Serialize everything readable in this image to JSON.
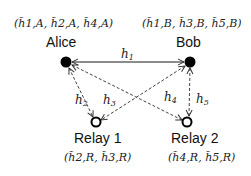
{
  "nodes": {
    "alice": {
      "label": "Alice",
      "tuple": "(h̃1,A, h̃2,A, h̃4,A)"
    },
    "bob": {
      "label": "Bob",
      "tuple": "(h̃1,B, h̃3,B, h̃5,B)"
    },
    "relay1": {
      "label": "Relay 1",
      "tuple": "(h̃2,R, h̃3,R)"
    },
    "relay2": {
      "label": "Relay 2",
      "tuple": "(h̃4,R, h̃5,R)"
    }
  },
  "edges": {
    "h1": {
      "label": "h",
      "sub": "1",
      "from": "alice",
      "to": "bob",
      "style": "solid"
    },
    "h2": {
      "label": "h",
      "sub": "2",
      "from": "alice",
      "to": "relay1",
      "style": "dashed"
    },
    "h3": {
      "label": "h",
      "sub": "3",
      "from": "bob",
      "to": "relay1",
      "style": "dashed"
    },
    "h4": {
      "label": "h",
      "sub": "4",
      "from": "alice",
      "to": "relay2",
      "style": "dashed"
    },
    "h5": {
      "label": "h",
      "sub": "5",
      "from": "bob",
      "to": "relay2",
      "style": "dashed"
    }
  }
}
